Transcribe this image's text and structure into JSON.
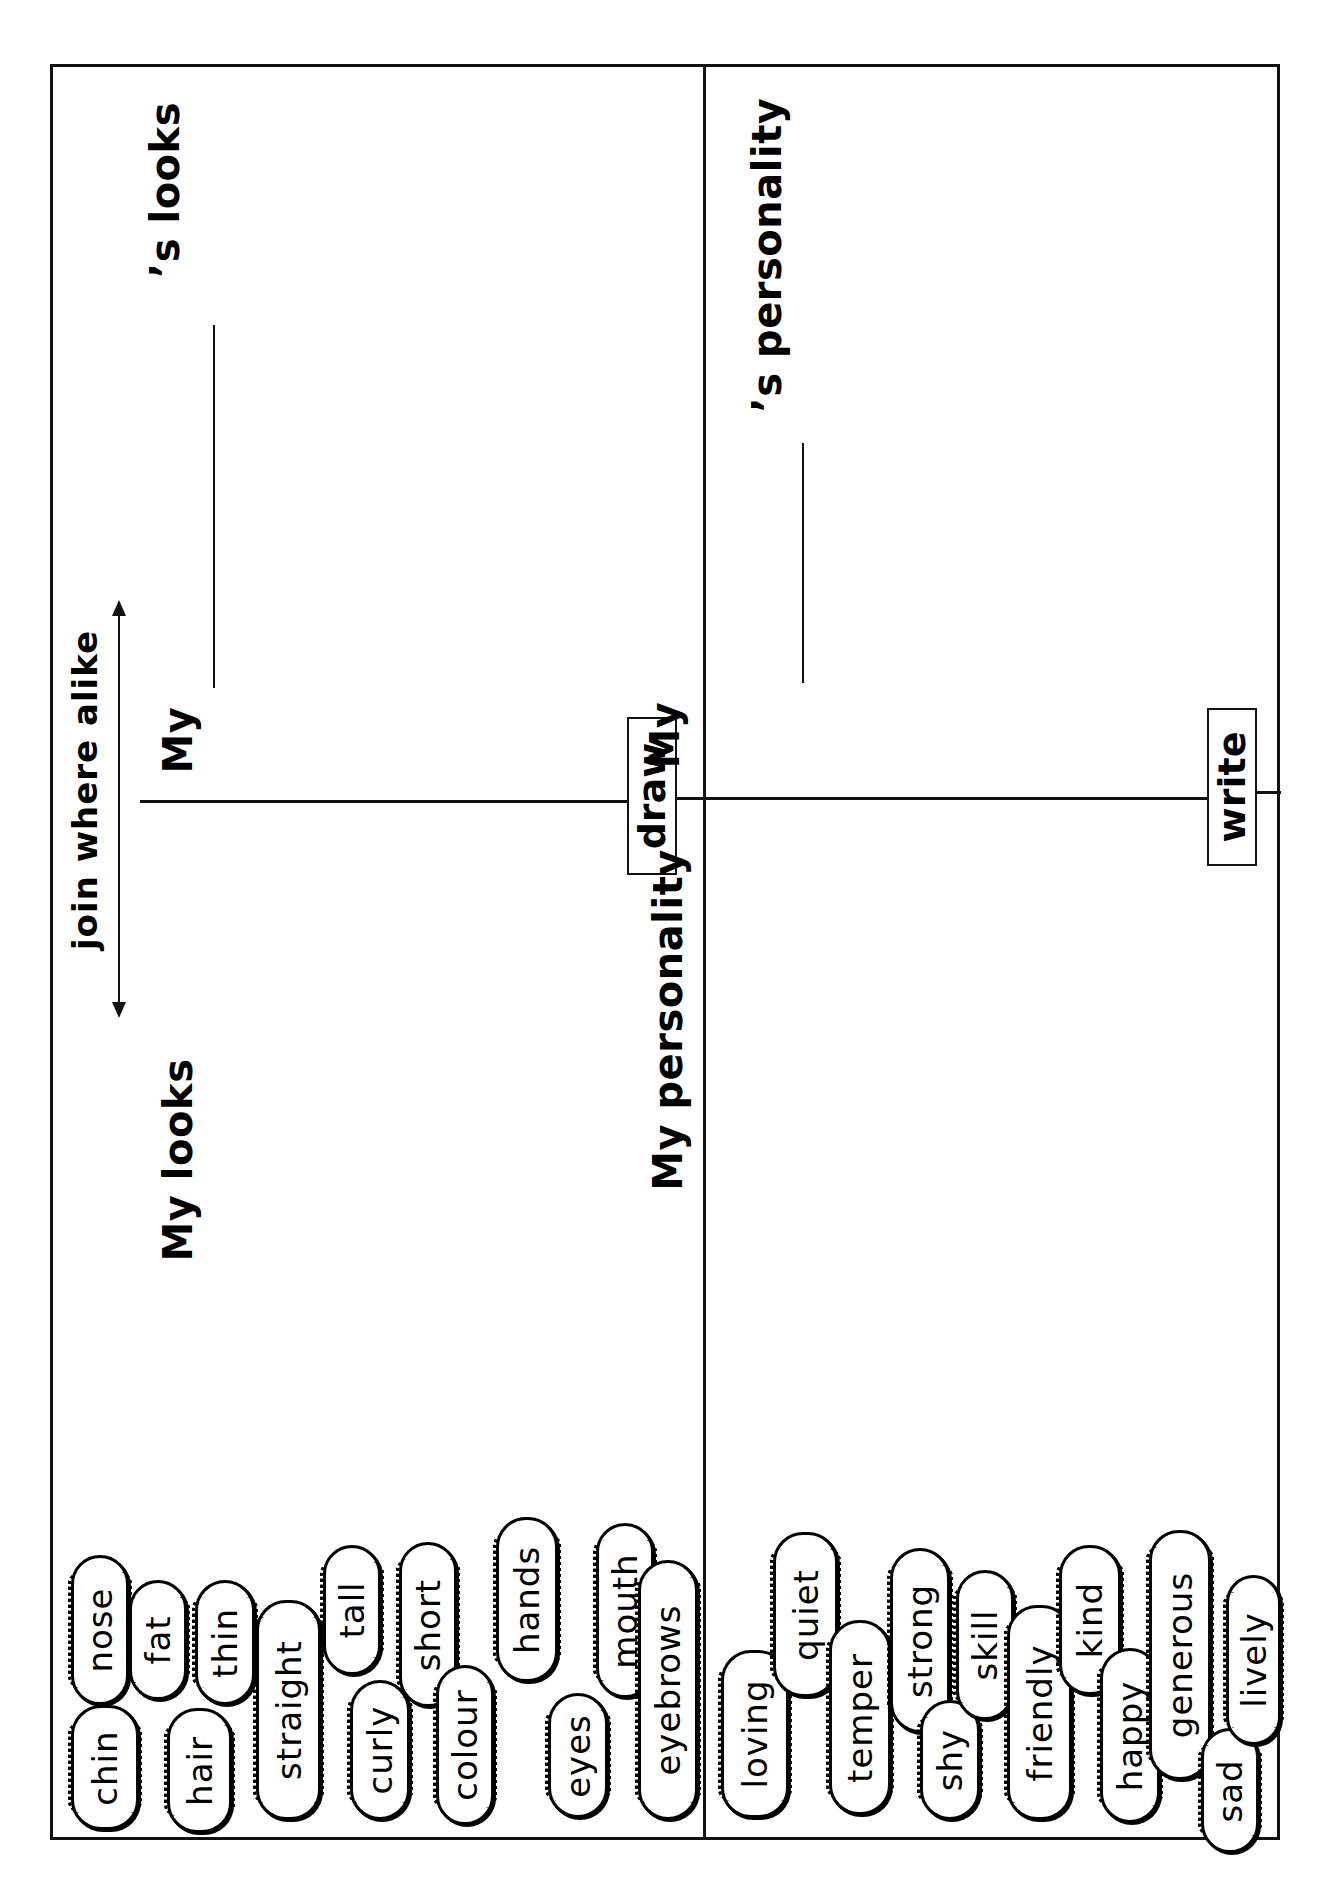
{
  "worksheet": {
    "orientation": "rotated-90-ccw",
    "instruction_arrow": "join where alike",
    "panels": {
      "looks": {
        "self_heading": "My looks",
        "other_heading_prefix": "My",
        "other_heading_suffix": "’s looks",
        "action_label": "draw",
        "words": [
          "chin",
          "nose",
          "fat",
          "hair",
          "thin",
          "straight",
          "tall",
          "curly",
          "short",
          "colour",
          "hands",
          "eyes",
          "mouth",
          "eyebrows"
        ]
      },
      "personality": {
        "self_heading": "My personality",
        "other_heading_prefix": "My",
        "other_heading_suffix": "’s personality",
        "action_label": "write",
        "words": [
          "loving",
          "quiet",
          "temper",
          "strong",
          "shy",
          "skill",
          "friendly",
          "kind",
          "happy",
          "generous",
          "sad",
          "lively"
        ]
      }
    }
  },
  "colors": {
    "ink": "#111111",
    "paper": "#ffffff"
  }
}
